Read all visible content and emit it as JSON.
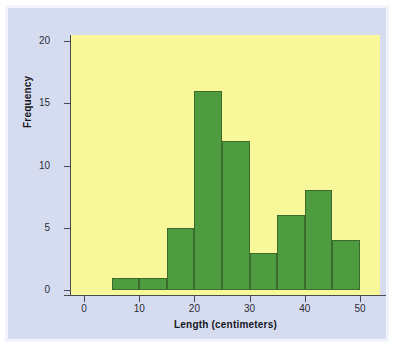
{
  "chart_data": {
    "type": "bar",
    "chart_subtype": "histogram",
    "title": "",
    "xlabel": "Length (centimeters)",
    "ylabel": "Frequency",
    "xlim": [
      -3,
      53
    ],
    "ylim": [
      0,
      21
    ],
    "grid": false,
    "legend": null,
    "bin_width": 5,
    "bin_edges": [
      5,
      10,
      15,
      20,
      25,
      30,
      35,
      40,
      45,
      50
    ],
    "categories": [
      "5-10",
      "10-15",
      "15-20",
      "20-25",
      "25-30",
      "30-35",
      "35-40",
      "40-45",
      "45-50"
    ],
    "values": [
      1,
      1,
      5,
      16,
      12,
      3,
      6,
      8,
      4
    ],
    "bars": [
      {
        "x0": 5,
        "x1": 10,
        "value": 1
      },
      {
        "x0": 10,
        "x1": 15,
        "value": 1
      },
      {
        "x0": 15,
        "x1": 20,
        "value": 5
      },
      {
        "x0": 20,
        "x1": 25,
        "value": 16
      },
      {
        "x0": 25,
        "x1": 30,
        "value": 12
      },
      {
        "x0": 30,
        "x1": 35,
        "value": 3
      },
      {
        "x0": 35,
        "x1": 40,
        "value": 6
      },
      {
        "x0": 40,
        "x1": 45,
        "value": 8
      },
      {
        "x0": 45,
        "x1": 50,
        "value": 4
      }
    ],
    "xticks": [
      0,
      10,
      20,
      30,
      40,
      50
    ],
    "xtick_labels": [
      "0",
      "10",
      "20",
      "30",
      "40",
      "50"
    ],
    "yticks": [
      0,
      5,
      10,
      15,
      20
    ],
    "ytick_labels": [
      "0",
      "5",
      "10",
      "15",
      "20"
    ],
    "colors": {
      "bar_fill": "#4f9b3f",
      "bar_edge": "#3a6b2a",
      "plot_background": "#f8f89a",
      "figure_background": "#d6dcf0",
      "frame": "#f2f4fb",
      "axis": "#4a4a52",
      "text": "#16161e"
    }
  }
}
